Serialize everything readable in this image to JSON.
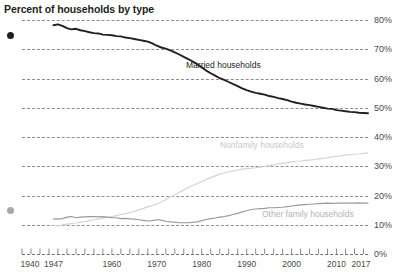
{
  "chart_data": {
    "type": "line",
    "title": "Percent of households by type",
    "xlabel": "",
    "ylabel": "",
    "ylim": [
      0,
      80
    ],
    "xlim": [
      1940,
      2017
    ],
    "grid": true,
    "legend_position": "inline-annotations",
    "y_ticks": [
      "0%",
      "10%",
      "20%",
      "30%",
      "40%",
      "50%",
      "60%",
      "70%",
      "80%"
    ],
    "y_tick_values": [
      0,
      10,
      20,
      30,
      40,
      50,
      60,
      70,
      80
    ],
    "x_ticks": [
      "1940",
      "1947",
      "1960",
      "1970",
      "1980",
      "1990",
      "2000",
      "2010",
      "2017"
    ],
    "x_tick_values": [
      1940,
      1947,
      1960,
      1970,
      1980,
      1990,
      2000,
      2010,
      2017
    ],
    "series": [
      {
        "name": "Married households",
        "color": "#231f20",
        "x": [
          1947,
          1948,
          1949,
          1950,
          1951,
          1952,
          1953,
          1954,
          1955,
          1956,
          1957,
          1958,
          1959,
          1960,
          1961,
          1962,
          1963,
          1964,
          1965,
          1966,
          1967,
          1968,
          1969,
          1970,
          1971,
          1972,
          1973,
          1974,
          1975,
          1976,
          1977,
          1978,
          1979,
          1980,
          1981,
          1982,
          1983,
          1984,
          1985,
          1986,
          1987,
          1988,
          1989,
          1990,
          1991,
          1992,
          1993,
          1994,
          1995,
          1996,
          1997,
          1998,
          1999,
          2000,
          2001,
          2002,
          2003,
          2004,
          2005,
          2006,
          2007,
          2008,
          2009,
          2010,
          2011,
          2012,
          2013,
          2014,
          2015,
          2016,
          2017
        ],
        "values": [
          78.2,
          78.5,
          78.0,
          77.2,
          76.8,
          77.0,
          76.5,
          76.2,
          75.8,
          75.5,
          75.4,
          75.0,
          74.9,
          74.8,
          74.5,
          74.4,
          74.0,
          73.8,
          73.5,
          73.2,
          72.9,
          72.6,
          72.0,
          71.2,
          70.6,
          70.2,
          69.6,
          68.9,
          68.2,
          67.4,
          66.6,
          65.8,
          64.9,
          63.8,
          62.7,
          61.8,
          61.0,
          60.1,
          59.5,
          58.8,
          58.1,
          57.4,
          56.6,
          56.0,
          55.5,
          55.1,
          54.8,
          54.5,
          54.0,
          53.7,
          53.3,
          53.0,
          52.6,
          52.1,
          51.7,
          51.4,
          51.1,
          50.9,
          50.6,
          50.3,
          50.0,
          49.7,
          49.6,
          49.2,
          49.0,
          48.8,
          48.6,
          48.5,
          48.3,
          48.2,
          48.1
        ]
      },
      {
        "name": "Nonfamily households",
        "color": "#d3d3d3",
        "x": [
          1947,
          1948,
          1949,
          1950,
          1951,
          1952,
          1953,
          1954,
          1955,
          1956,
          1957,
          1958,
          1959,
          1960,
          1961,
          1962,
          1963,
          1964,
          1965,
          1966,
          1967,
          1968,
          1969,
          1970,
          1971,
          1972,
          1973,
          1974,
          1975,
          1976,
          1977,
          1978,
          1979,
          1980,
          1981,
          1982,
          1983,
          1984,
          1985,
          1986,
          1987,
          1988,
          1989,
          1990,
          1991,
          1992,
          1993,
          1994,
          1995,
          1996,
          1997,
          1998,
          1999,
          2000,
          2001,
          2002,
          2003,
          2004,
          2005,
          2006,
          2007,
          2008,
          2009,
          2010,
          2011,
          2012,
          2013,
          2014,
          2015,
          2016,
          2017
        ],
        "values": [
          9.8,
          9.6,
          9.9,
          10.2,
          10.4,
          10.6,
          10.9,
          11.1,
          11.4,
          11.7,
          11.9,
          12.2,
          12.5,
          12.8,
          13.1,
          13.5,
          13.8,
          14.2,
          14.6,
          15.1,
          15.6,
          16.1,
          16.6,
          17.1,
          17.8,
          18.6,
          19.4,
          20.2,
          21.1,
          21.9,
          22.7,
          23.4,
          24.1,
          24.8,
          25.5,
          26.1,
          26.7,
          27.3,
          27.7,
          28.1,
          28.4,
          28.7,
          29.0,
          29.2,
          29.3,
          29.5,
          29.7,
          29.9,
          30.2,
          30.5,
          30.8,
          31.0,
          31.2,
          31.5,
          31.7,
          31.8,
          32.0,
          32.1,
          32.3,
          32.5,
          32.7,
          32.9,
          33.1,
          33.4,
          33.6,
          33.8,
          34.0,
          34.1,
          34.2,
          34.4,
          34.5
        ]
      },
      {
        "name": "Other family households",
        "color": "#9a9a9a",
        "x": [
          1947,
          1948,
          1949,
          1950,
          1951,
          1952,
          1953,
          1954,
          1955,
          1956,
          1957,
          1958,
          1959,
          1960,
          1961,
          1962,
          1963,
          1964,
          1965,
          1966,
          1967,
          1968,
          1969,
          1970,
          1971,
          1972,
          1973,
          1974,
          1975,
          1976,
          1977,
          1978,
          1979,
          1980,
          1981,
          1982,
          1983,
          1984,
          1985,
          1986,
          1987,
          1988,
          1989,
          1990,
          1991,
          1992,
          1993,
          1994,
          1995,
          1996,
          1997,
          1998,
          1999,
          2000,
          2001,
          2002,
          2003,
          2004,
          2005,
          2006,
          2007,
          2008,
          2009,
          2010,
          2011,
          2012,
          2013,
          2014,
          2015,
          2016,
          2017
        ],
        "values": [
          12.0,
          11.9,
          12.1,
          12.6,
          12.8,
          12.4,
          12.6,
          12.7,
          12.8,
          12.8,
          12.7,
          12.8,
          12.6,
          12.4,
          12.4,
          12.1,
          12.2,
          12.0,
          11.9,
          11.7,
          11.5,
          11.3,
          11.4,
          11.7,
          11.6,
          11.2,
          11.0,
          10.9,
          10.7,
          10.7,
          10.7,
          10.8,
          11.0,
          11.4,
          11.8,
          12.1,
          12.3,
          12.6,
          12.8,
          13.1,
          13.5,
          13.9,
          14.4,
          14.8,
          15.2,
          15.4,
          15.5,
          15.6,
          15.8,
          15.8,
          15.9,
          16.0,
          16.2,
          16.4,
          16.6,
          16.8,
          16.9,
          17.0,
          17.1,
          17.2,
          17.3,
          17.4,
          17.3,
          17.4,
          17.4,
          17.4,
          17.4,
          17.4,
          17.5,
          17.4,
          17.4
        ]
      }
    ],
    "annotations": [
      {
        "text": "Married households",
        "series": "Married households"
      },
      {
        "text": "Nonfamily households",
        "series": "Nonfamily households"
      },
      {
        "text": "Other family households",
        "series": "Other family households"
      }
    ]
  },
  "markers": {
    "married_dot_color": "#231f20",
    "nonfamily_dot_color": "#a8a8a8"
  }
}
